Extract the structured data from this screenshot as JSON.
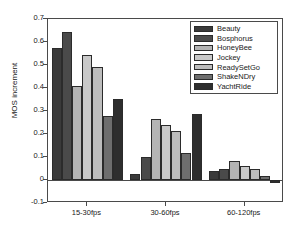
{
  "chart_data": {
    "type": "bar",
    "title": "",
    "xlabel": "",
    "ylabel": "MOS increment",
    "categories": [
      "15-30fps",
      "30-60fps",
      "60-120fps"
    ],
    "ylim": [
      -0.1,
      0.7
    ],
    "ytick_labels": [
      "0.7",
      "0.6",
      "0.5",
      "0.4",
      "0.3",
      "0.2",
      "0.1",
      "0",
      "-0.1"
    ],
    "ytick_values": [
      0.7,
      0.6,
      0.5,
      0.4,
      0.3,
      0.2,
      0.1,
      0,
      -0.1
    ],
    "grid": false,
    "legend_position": "top-right",
    "series": [
      {
        "name": "Beauty",
        "color": "#3a3a3a",
        "values": [
          0.575,
          0.027,
          0.041
        ]
      },
      {
        "name": "Bosphorus",
        "color": "#4a4a4a",
        "values": [
          0.645,
          0.098,
          0.048
        ]
      },
      {
        "name": "HoneyBee",
        "color": "#b4b4b4",
        "values": [
          0.41,
          0.267,
          0.081
        ]
      },
      {
        "name": "Jockey",
        "color": "#c9c9c9",
        "values": [
          0.545,
          0.238,
          0.063
        ]
      },
      {
        "name": "ReadySetGo",
        "color": "#bdbdbd",
        "values": [
          0.492,
          0.212,
          0.049
        ]
      },
      {
        "name": "ShakeNDry",
        "color": "#6e6e6e",
        "values": [
          0.28,
          0.119,
          0.018
        ]
      },
      {
        "name": "YachtRide",
        "color": "#2e2e2e",
        "values": [
          0.353,
          0.289,
          -0.015
        ]
      }
    ]
  },
  "legend": {
    "items": [
      "Beauty",
      "Bosphorus",
      "HoneyBee",
      "Jockey",
      "ReadySetGo",
      "ShakeNDry",
      "YachtRide"
    ]
  },
  "axes": {
    "y_title": "MOS increment"
  }
}
